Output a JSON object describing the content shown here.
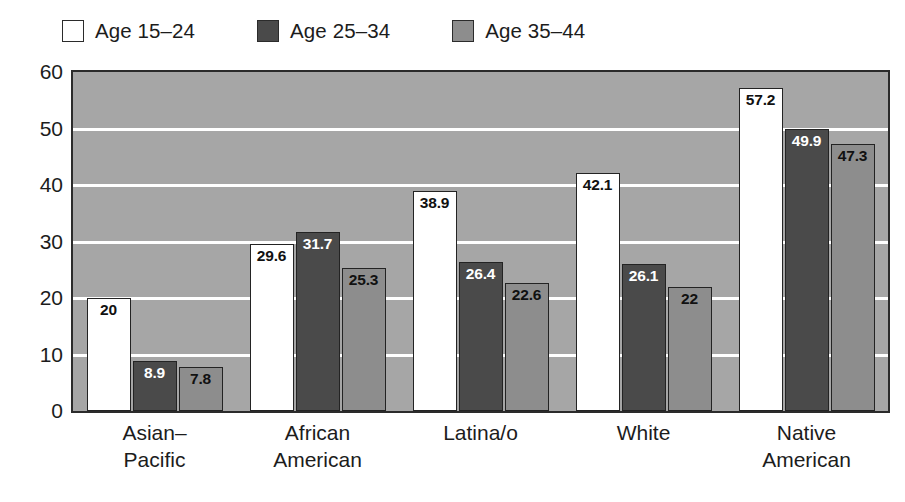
{
  "legend": {
    "position": "top-left",
    "items": [
      {
        "label": "Age 15–24",
        "color": "#ffffff",
        "key": "age_15_24"
      },
      {
        "label": "Age 25–34",
        "color": "#4a4a4a",
        "key": "age_25_34"
      },
      {
        "label": "Age 35–44",
        "color": "#8d8d8d",
        "key": "age_35_44"
      }
    ]
  },
  "axes": {
    "y_ticks": [
      "60",
      "50",
      "40",
      "30",
      "20",
      "10",
      "0"
    ],
    "x_categories": [
      [
        "Asian–",
        "Pacific"
      ],
      [
        "African",
        "American"
      ],
      [
        "Latina/o"
      ],
      [
        "White"
      ],
      [
        "Native",
        "American"
      ]
    ]
  },
  "colors": {
    "plot_background": "#a6a6a6",
    "gridline": "#ffffff",
    "frame": "#2b2b2b",
    "bar_light": "#ffffff",
    "bar_dark": "#4a4a4a",
    "bar_medium": "#8d8d8d",
    "value_label_on_light": "#111111",
    "value_label_on_dark": "#ffffff"
  },
  "chart_data": {
    "type": "bar",
    "title": "",
    "subtitle": "",
    "xlabel": "",
    "ylabel": "",
    "ylim": [
      0,
      60
    ],
    "y_tick_step": 10,
    "grid": true,
    "legend_position": "top-left",
    "categories": [
      "Asian–Pacific",
      "African American",
      "Latina/o",
      "White",
      "Native American"
    ],
    "series": [
      {
        "name": "Age 15–24",
        "color": "#ffffff",
        "values": [
          20,
          29.6,
          38.9,
          42.1,
          57.2
        ],
        "labels": [
          "20",
          "29.6",
          "38.9",
          "42.1",
          "57.2"
        ]
      },
      {
        "name": "Age 25–34",
        "color": "#4a4a4a",
        "values": [
          8.9,
          31.7,
          26.4,
          26.1,
          49.9
        ],
        "labels": [
          "8.9",
          "31.7",
          "26.4",
          "26.1",
          "49.9"
        ]
      },
      {
        "name": "Age 35–44",
        "color": "#8d8d8d",
        "values": [
          7.8,
          25.3,
          22.6,
          22,
          47.3
        ],
        "labels": [
          "7.8",
          "25.3",
          "22.6",
          "22",
          "47.3"
        ]
      }
    ]
  }
}
